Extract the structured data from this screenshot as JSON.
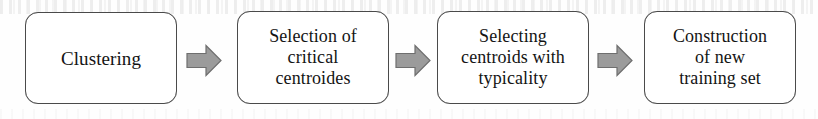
{
  "diagram": {
    "type": "horizontal-flowchart",
    "orientation": "left-to-right",
    "step_count": 4,
    "connector_count": 3,
    "colors": {
      "node_border": "#4a4a4a",
      "node_fill": "#ffffff",
      "text": "#141414",
      "arrow_fill": "#9b9b9b",
      "arrow_stroke": "#6e6e6e",
      "page_background": "#fefefe"
    },
    "nodes": [
      {
        "id": "clustering",
        "label": "Clustering"
      },
      {
        "id": "selection-critical-centroides",
        "label": "Selection of\ncritical\ncentroides"
      },
      {
        "id": "selecting-centroids-typicality",
        "label": "Selecting\ncentroids with\ntypicality"
      },
      {
        "id": "construction-new-training-set",
        "label": "Construction\nof new\ntraining set"
      }
    ],
    "connectors": [
      {
        "id": "arrow-1",
        "icon": "block-arrow-right-icon",
        "from": "clustering",
        "to": "selection-critical-centroides"
      },
      {
        "id": "arrow-2",
        "icon": "block-arrow-right-icon",
        "from": "selection-critical-centroides",
        "to": "selecting-centroids-typicality"
      },
      {
        "id": "arrow-3",
        "icon": "block-arrow-right-icon",
        "from": "selecting-centroids-typicality",
        "to": "construction-new-training-set"
      }
    ]
  }
}
